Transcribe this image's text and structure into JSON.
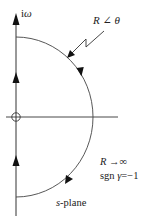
{
  "diagram": {
    "axis_label_imag": "iω",
    "arc_label": "R ∠ θ",
    "condition_R": "R →∞",
    "condition_sgn": "sgn γ=−1",
    "plane_label": "s-plane",
    "colors": {
      "line": "#333333",
      "text": "#222222",
      "background": "#ffffff"
    },
    "elements": {
      "vertical_axis": {
        "x": 16,
        "y_top": 15,
        "y_bottom": 216,
        "arrow_top": true,
        "direction_arrows_y": [
          77,
          160
        ],
        "direction": "up"
      },
      "horizontal_axis": {
        "y": 117,
        "x_left": 6,
        "x_right": 118
      },
      "origin_marker": {
        "shape": "circle-cross",
        "cx": 16,
        "cy": 117,
        "r": 4
      },
      "arc": {
        "center": [
          16,
          117
        ],
        "rx": 77,
        "ry": 80,
        "side": "right-half",
        "direction": "clockwise",
        "arrow_positions": [
          [
            80,
            72
          ],
          [
            67,
            180
          ]
        ]
      },
      "leader_line": {
        "shape": "zigzag",
        "from": [
          105,
          30
        ],
        "to": [
          68,
          57
        ]
      }
    }
  }
}
